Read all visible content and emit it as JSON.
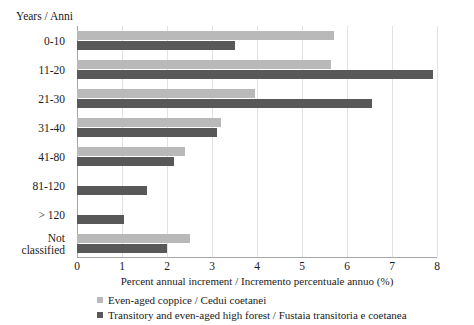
{
  "chart_data": {
    "type": "bar",
    "orientation": "horizontal",
    "title": "",
    "ylabel": "Years / Anni",
    "xlabel": "Percent annual increment / Incremento  percentuale annuo (%)",
    "xlim": [
      0,
      8
    ],
    "xticks": [
      "0",
      "1",
      "2",
      "3",
      "4",
      "5",
      "6",
      "7",
      "8"
    ],
    "grid": true,
    "legend_position": "bottom",
    "categories": [
      "0-10",
      "11-20",
      "21-30",
      "31-40",
      "41-80",
      "81-120",
      "> 120",
      "Not\nclassified"
    ],
    "series": [
      {
        "name": "Even-aged coppice / Cedui coetanei",
        "color": "#b9b9b9",
        "values": [
          5.7,
          5.65,
          3.95,
          3.2,
          2.4,
          null,
          null,
          2.5
        ]
      },
      {
        "name": "Transitory and even-aged high forest / Fustaia transitoria e coetanea",
        "color": "#585858",
        "values": [
          3.5,
          7.9,
          6.55,
          3.1,
          2.15,
          1.55,
          1.05,
          2.0
        ]
      }
    ]
  },
  "legend": {
    "items": [
      {
        "label": "Even-aged coppice / Cedui coetanei",
        "color": "#b9b9b9"
      },
      {
        "label": "Transitory and even-aged high forest / Fustaia transitoria e coetanea",
        "color": "#585858"
      }
    ]
  }
}
